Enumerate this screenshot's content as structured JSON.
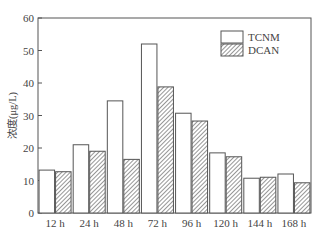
{
  "chart_data": {
    "type": "bar",
    "title": "",
    "xlabel": "",
    "ylabel": "浓度(μg/L)",
    "ylim": [
      0,
      60
    ],
    "yticks": [
      0,
      10,
      20,
      30,
      40,
      50,
      60
    ],
    "grid": false,
    "legend_position": "upper right",
    "categories": [
      "12 h",
      "24 h",
      "48 h",
      "72 h",
      "96 h",
      "120 h",
      "144 h",
      "168 h"
    ],
    "series": [
      {
        "name": "TCNM",
        "fill": "white",
        "values": [
          13.2,
          21.0,
          34.5,
          52.0,
          30.7,
          18.5,
          10.7,
          12.0
        ]
      },
      {
        "name": "DCAN",
        "fill": "hatched",
        "values": [
          12.7,
          19.0,
          16.5,
          38.8,
          28.3,
          17.3,
          11.0,
          9.3
        ]
      }
    ]
  },
  "colors": {
    "axis": "#555555",
    "bar_stroke": "#555555",
    "hatch": "#777777",
    "text": "#444444"
  }
}
